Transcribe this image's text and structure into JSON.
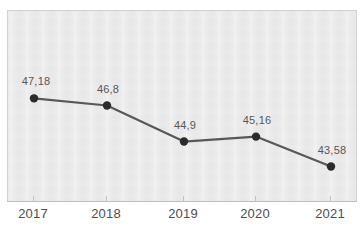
{
  "chart_data": {
    "type": "line",
    "title": "",
    "subtitle": "",
    "xlabel": "",
    "ylabel": "",
    "categories": [
      "2017",
      "2018",
      "2019",
      "2020",
      "2021"
    ],
    "values": [
      47.18,
      46.8,
      44.9,
      45.16,
      43.58
    ],
    "value_labels": [
      "47,18",
      "46,8",
      "44,9",
      "45,16",
      "43,58"
    ],
    "decimal_separator": ",",
    "ylim": [
      42.5,
      48.2
    ],
    "grid": false,
    "legend": null,
    "series": [
      {
        "name": "",
        "values": [
          47.18,
          46.8,
          44.9,
          45.16,
          43.58
        ],
        "line_color": "#58585a",
        "marker_color": "#2b2b2b",
        "marker": "circle"
      }
    ],
    "annotations": []
  },
  "style": {
    "plot_background": "#e9e9e9",
    "plot_border": "#d2d2d2",
    "page_background": "#ffffff",
    "axis_color": "#bdbdbd",
    "tick_color": "#c2c2c2",
    "value_label_color": "#58585a",
    "tick_label_color": "#4d4d4f"
  },
  "top_sliver_text": ""
}
